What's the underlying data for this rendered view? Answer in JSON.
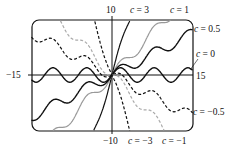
{
  "chart_data": {
    "type": "line",
    "title": "",
    "xlabel": "",
    "ylabel": "",
    "xlim": [
      -15,
      15
    ],
    "ylim": [
      -10,
      10
    ],
    "grid": false,
    "axis_labels": {
      "x_min": "−15",
      "x_max": "15",
      "y_max": "10",
      "y_min": "−10"
    },
    "series": [
      {
        "name": "c = 3",
        "label": "c = 3",
        "c": 3,
        "style": "solid-black-thin"
      },
      {
        "name": "c = 1",
        "label": "c = 1",
        "c": 1,
        "style": "solid-gray"
      },
      {
        "name": "c = 0.5",
        "label": "c = 0.5",
        "c": 0.5,
        "style": "solid-black"
      },
      {
        "name": "c = 0",
        "label": "c = 0",
        "c": 0,
        "style": "solid-black"
      },
      {
        "name": "c = -0.5",
        "label": "c = −0.5",
        "c": -0.5,
        "style": "dashed-black"
      },
      {
        "name": "c = -1",
        "label": "c = −1",
        "c": -1,
        "style": "dashed-gray"
      },
      {
        "name": "c = -3",
        "label": "c = −3",
        "c": -3,
        "style": "dashed-black"
      }
    ],
    "annotations": [
      {
        "text": "c = 3",
        "position": "top"
      },
      {
        "text": "c = 1",
        "position": "top-right"
      },
      {
        "text": "c = 0.5",
        "position": "right"
      },
      {
        "text": "c = 0",
        "position": "right"
      },
      {
        "text": "c = −0.5",
        "position": "right"
      },
      {
        "text": "c = −3",
        "position": "bottom"
      },
      {
        "text": "c = −1",
        "position": "bottom-right"
      }
    ]
  }
}
